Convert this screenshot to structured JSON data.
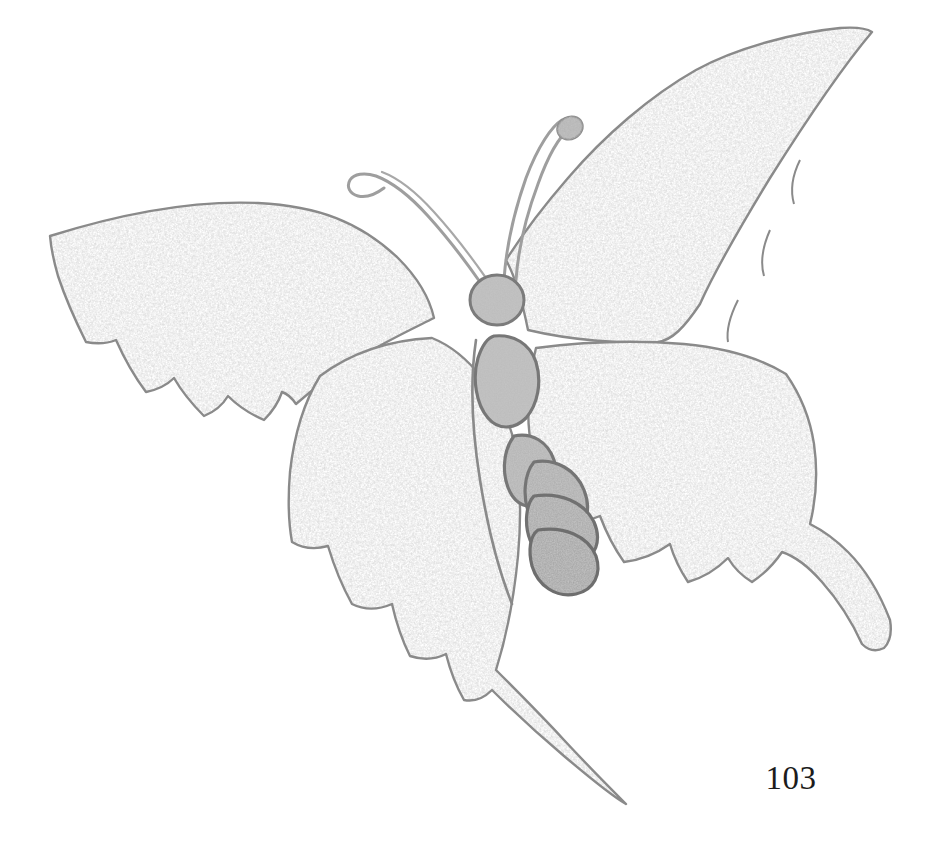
{
  "page": {
    "background_color": "#ffffff",
    "page_number": "103",
    "page_number_color": "#1c1c1c"
  },
  "figure": {
    "name": "butterfly-engraving",
    "caption": "",
    "style": "stipple-engraving",
    "palette": {
      "background": "#ffffff",
      "wing_fill": "#ffffff",
      "wing_stipple_light": "#c9c9c9",
      "wing_stipple_mid": "#b0b0b0",
      "wing_stipple_dark": "#9b9b9b",
      "outline": "#8a8a8a",
      "outline_dark": "#777777",
      "body_fill": "#b3b3b3",
      "body_stipple": "#9a9a9a",
      "body_outline": "#6f6f6f",
      "antenna_outline": "#9a9a9a"
    },
    "parts": [
      {
        "id": "upper-left-wing",
        "label": "Upper left wing",
        "shape": "elongate-falcate",
        "margin": "scalloped",
        "fill": "stippled-grey"
      },
      {
        "id": "upper-right-wing",
        "label": "Upper right wing",
        "shape": "elongate-falcate",
        "margin": "scalloped",
        "fill": "stippled-grey"
      },
      {
        "id": "lower-left-wing",
        "label": "Lower left wing",
        "shape": "scalloped-with-tail",
        "margin": "deeply-scalloped",
        "fill": "stippled-grey",
        "tail": "long-curving-swallowtail"
      },
      {
        "id": "lower-right-wing",
        "label": "Lower right wing",
        "shape": "scalloped-with-tail",
        "margin": "scalloped",
        "fill": "stippled-grey",
        "tail": "long-curving-swallowtail"
      },
      {
        "id": "head",
        "label": "Head",
        "shape": "circle",
        "fill": "stippled-grey"
      },
      {
        "id": "thorax",
        "label": "Thorax segment",
        "shape": "teardrop",
        "fill": "stippled-grey"
      },
      {
        "id": "abdomen",
        "label": "Abdomen",
        "segments": 4,
        "shape": "crescent-segments",
        "fill": "stippled-grey"
      },
      {
        "id": "left-antenna",
        "label": "Left antenna",
        "shape": "curved-hooked",
        "tip": "hook"
      },
      {
        "id": "right-antenna",
        "label": "Right antenna",
        "shape": "curved-clubbed",
        "tip": "club"
      }
    ]
  }
}
